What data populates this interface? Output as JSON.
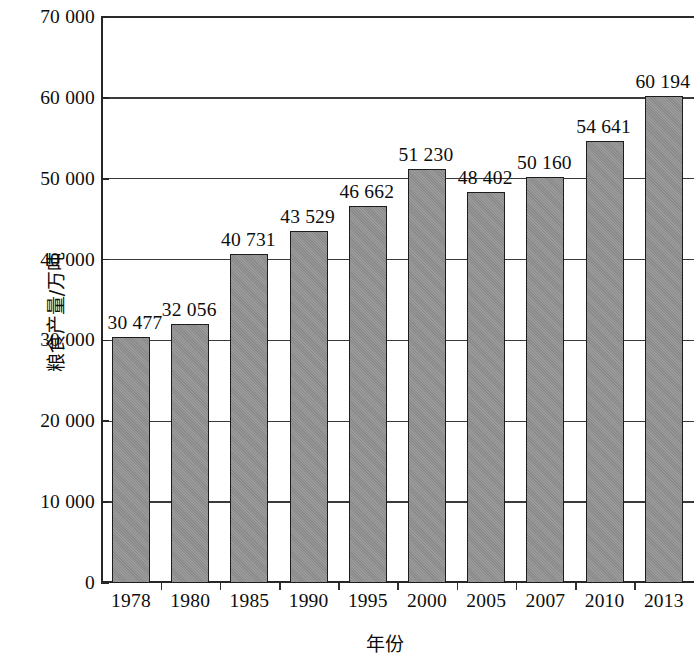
{
  "chart_data": {
    "type": "bar",
    "title": "",
    "xlabel": "年份",
    "ylabel": "粮食产量/万吨",
    "categories": [
      "1978",
      "1980",
      "1985",
      "1990",
      "1995",
      "2000",
      "2005",
      "2007",
      "2010",
      "2013"
    ],
    "values": [
      30477,
      32056,
      40731,
      43529,
      46662,
      51230,
      48402,
      50160,
      54641,
      60194
    ],
    "value_labels": [
      "30 477",
      "32 056",
      "40 731",
      "43 529",
      "46 662",
      "51 230",
      "48 402",
      "50 160",
      "54 641",
      "60 194"
    ],
    "ylim": [
      0,
      70000
    ],
    "ytick_values": [
      0,
      10000,
      20000,
      30000,
      40000,
      50000,
      60000,
      70000
    ],
    "ytick_labels": [
      "0",
      "10 000",
      "20 000",
      "30 000",
      "40 000",
      "50 000",
      "60 000",
      "70 000"
    ],
    "grid": "horizontal",
    "legend": "none",
    "bar_color": "#909090",
    "bar_edge_color": "#1d1d1d",
    "axis_color": "#262626",
    "background_color": "#ffffff"
  }
}
